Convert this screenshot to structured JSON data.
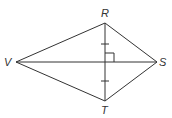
{
  "diagram": {
    "type": "kite",
    "stroke_color": "#333333",
    "background": "#ffffff",
    "vertices": {
      "R": {
        "label": "R",
        "x": 105,
        "y": 23
      },
      "S": {
        "label": "S",
        "x": 157,
        "y": 62
      },
      "T": {
        "label": "T",
        "x": 105,
        "y": 101
      },
      "V": {
        "label": "V",
        "x": 16,
        "y": 62
      }
    },
    "sides": [
      "VR",
      "RS",
      "ST",
      "TV"
    ],
    "diagonals": [
      "VS",
      "RT"
    ],
    "markings": {
      "congruent_ticks": [
        "R-to-intersection",
        "intersection-to-T"
      ],
      "right_angle": "at intersection of RT and VS"
    }
  }
}
